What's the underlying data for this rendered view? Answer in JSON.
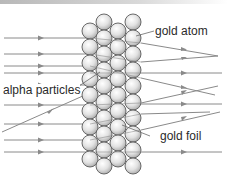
{
  "labels": {
    "gold_atom": "gold atom",
    "alpha_particles": "alpha particles",
    "gold_foil": "gold foil"
  },
  "colors": {
    "line": "#8a8a8a",
    "atom_fill_light": "#f4f4f4",
    "atom_fill_dark": "#b8b8b8",
    "atom_stroke": "#5a5a5a",
    "text": "#2a2a2a"
  },
  "foil": {
    "columns": 4,
    "atoms_per_column": [
      9,
      10,
      9,
      10
    ],
    "atom_radius": 8
  },
  "alpha_paths_count": 9
}
